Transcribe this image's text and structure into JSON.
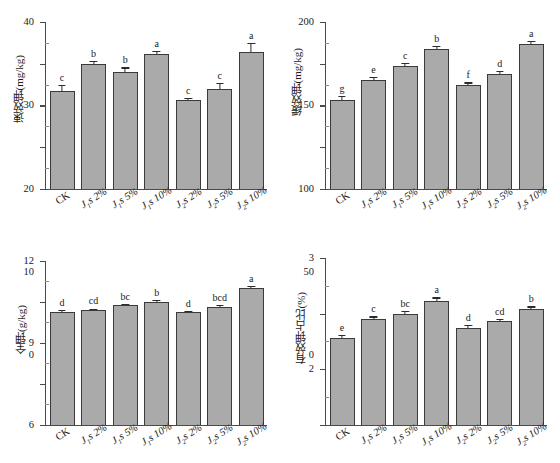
{
  "figure": {
    "bar_fill_color": "#aaaaaa",
    "bar_edge_color": "#3a3a3a",
    "axis_color": "#4a4a4a",
    "background_color": "#ffffff"
  },
  "categories": [
    "CK",
    "J1s 2%",
    "J1s 5%",
    "J1s 10%",
    "J2s 2%",
    "J2s 5%",
    "J2s 10%"
  ],
  "category_labels": [
    {
      "base": "CK",
      "sub": "",
      "suffix": ""
    },
    {
      "base": "J",
      "sub": "1",
      "suffix": "s 2%"
    },
    {
      "base": "J",
      "sub": "1",
      "suffix": "s 5%"
    },
    {
      "base": "J",
      "sub": "1",
      "suffix": "s 10%"
    },
    {
      "base": "J",
      "sub": "2",
      "suffix": "s 2%"
    },
    {
      "base": "J",
      "sub": "2",
      "suffix": "s 5%"
    },
    {
      "base": "J",
      "sub": "2",
      "suffix": "s 10%"
    }
  ],
  "chart_data": [
    {
      "id": "available-potassium",
      "type": "bar",
      "title": "",
      "xlabel": "",
      "ylabel": "速效钾(mg/kg)",
      "ylim": [
        0,
        40
      ],
      "yticks": [
        0,
        10,
        20,
        30,
        40
      ],
      "ytick_labels": [
        "0",
        "10",
        "20",
        "30",
        "40"
      ],
      "grid": false,
      "legend": "none",
      "categories": [
        "CK",
        "J1s 2%",
        "J1s 5%",
        "J1s 10%",
        "J2s 2%",
        "J2s 5%",
        "J2s 10%"
      ],
      "values": [
        23.4,
        29.9,
        28.0,
        32.3,
        21.2,
        23.9,
        32.7
      ],
      "errors": [
        1.6,
        0.8,
        1.1,
        0.8,
        0.5,
        1.5,
        2.2
      ],
      "sig_letters": [
        "c",
        "b",
        "b",
        "a",
        "c",
        "c",
        "a"
      ]
    },
    {
      "id": "slowly-available-potassium",
      "type": "bar",
      "title": "",
      "xlabel": "",
      "ylabel": "缓效钾(mg/kg)",
      "ylim": [
        0,
        200
      ],
      "yticks": [
        0,
        50,
        100,
        150,
        200
      ],
      "ytick_labels": [
        "0",
        "50",
        "100",
        "150",
        "200"
      ],
      "grid": false,
      "legend": "none",
      "categories": [
        "CK",
        "J1s 2%",
        "J1s 5%",
        "J1s 10%",
        "J2s 2%",
        "J2s 5%",
        "J2s 10%"
      ],
      "values": [
        107,
        131,
        147,
        168,
        124,
        138,
        174
      ],
      "errors": [
        4.5,
        3.5,
        3.5,
        3.0,
        3.5,
        3.0,
        3.0
      ],
      "sig_letters": [
        "g",
        "e",
        "c",
        "b",
        "f",
        "d",
        "a"
      ]
    },
    {
      "id": "total-potassium",
      "type": "bar",
      "title": "",
      "xlabel": "",
      "ylabel": "全钾(g/kg)",
      "ylim": [
        0,
        12
      ],
      "yticks": [
        0,
        3,
        6,
        9,
        12
      ],
      "ytick_labels": [
        "0",
        "3",
        "6",
        "9",
        "12"
      ],
      "grid": false,
      "legend": "none",
      "categories": [
        "CK",
        "J1s 2%",
        "J1s 5%",
        "J1s 10%",
        "J2s 2%",
        "J2s 5%",
        "J2s 10%"
      ],
      "values": [
        8.25,
        8.4,
        8.75,
        9.0,
        8.25,
        8.65,
        10.0
      ],
      "errors": [
        0.18,
        0.12,
        0.12,
        0.15,
        0.12,
        0.15,
        0.2
      ],
      "sig_letters": [
        "d",
        "cd",
        "bc",
        "b",
        "d",
        "bcd",
        "a"
      ]
    },
    {
      "id": "available-potassium-ratio",
      "type": "bar",
      "title": "",
      "xlabel": "",
      "ylabel": "有效钾占比(%)",
      "ylim": [
        0,
        3
      ],
      "yticks": [
        0,
        1,
        2,
        3
      ],
      "ytick_labels": [
        "0",
        "1",
        "2",
        "3"
      ],
      "grid": false,
      "legend": "none",
      "categories": [
        "CK",
        "J1s 2%",
        "J1s 5%",
        "J1s 10%",
        "J2s 2%",
        "J2s 5%",
        "J2s 10%"
      ],
      "values": [
        1.56,
        1.9,
        2.0,
        2.22,
        1.74,
        1.87,
        2.08
      ],
      "errors": [
        0.06,
        0.05,
        0.05,
        0.07,
        0.05,
        0.04,
        0.05
      ],
      "sig_letters": [
        "e",
        "c",
        "bc",
        "a",
        "d",
        "cd",
        "b"
      ]
    }
  ]
}
